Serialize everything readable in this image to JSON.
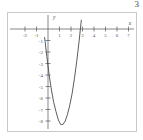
{
  "figure": {
    "corner_label": "3",
    "background_color": "#ffffff",
    "frame_color": "#c9c9c9"
  },
  "chart_data": {
    "type": "line",
    "title": "",
    "subtitle": "",
    "xlabel": "x",
    "ylabel": "y",
    "xlim": [
      -2.6,
      7.4
    ],
    "ylim": [
      -8.9,
      1.1
    ],
    "grid": false,
    "legend": null,
    "axis_color": "#555555",
    "curve_color": "#4a4a4a",
    "x_ticks": [
      -2,
      -1,
      1,
      2,
      3,
      4,
      5,
      6,
      7
    ],
    "x_tick_labels": [
      "-2",
      "-1",
      "1",
      "2",
      "3",
      "4",
      "5",
      "6",
      "7"
    ],
    "y_ticks": [
      -1,
      -2,
      -3,
      -4,
      -5,
      -6,
      -7,
      -8
    ],
    "y_tick_labels": [
      "-1",
      "-2",
      "-3",
      "-4",
      "-5",
      "-6",
      "-7",
      "-8"
    ],
    "series": [
      {
        "name": "parabola",
        "equation": "y = 3.4(x - 1.2)^2 - 8.3",
        "vertex": [
          1.2,
          -8.3
        ],
        "roots": [
          -0.36,
          2.76
        ],
        "x": [
          -0.85,
          -0.7,
          -0.5,
          -0.3,
          -0.1,
          0.1,
          0.3,
          0.5,
          0.7,
          0.9,
          1.1,
          1.2,
          1.3,
          1.5,
          1.7,
          1.9,
          2.1,
          2.3,
          2.5,
          2.7,
          2.9,
          3.0,
          3.1,
          3.2
        ],
        "y": [
          5.6,
          4.6,
          1.6,
          -0.7,
          -2.4,
          -4.0,
          -5.3,
          -6.4,
          -7.2,
          -7.9,
          -8.3,
          -8.3,
          -8.3,
          -8.0,
          -7.4,
          -6.6,
          -5.6,
          -4.3,
          -2.8,
          -1.1,
          0.8,
          1.8,
          2.9,
          4.1
        ]
      }
    ]
  }
}
